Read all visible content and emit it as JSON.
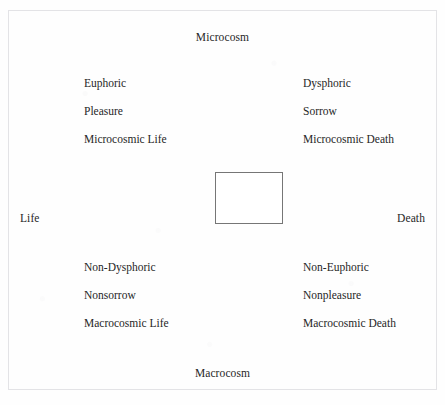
{
  "diagram": {
    "axes": {
      "top_label": "Microcosm",
      "bottom_label": "Macrocosm",
      "left_label": "Life",
      "right_label": "Death"
    },
    "quadrants": {
      "top_left": {
        "terms": [
          "Euphoric",
          "Pleasure",
          "Microcosmic Life"
        ]
      },
      "top_right": {
        "terms": [
          "Dysphoric",
          "Sorrow",
          "Microcosmic Death"
        ]
      },
      "bottom_left": {
        "terms": [
          "Non-Dysphoric",
          "Nonsorrow",
          "Macrocosmic Life"
        ]
      },
      "bottom_right": {
        "terms": [
          "Non-Euphoric",
          "Nonpleasure",
          "Macrocosmic Death"
        ]
      }
    },
    "center_box": {
      "label": ""
    },
    "colors": {
      "page_background": "#fefefe",
      "page_border": "#e3e3e6",
      "text": "#262626",
      "box_border": "#767676"
    }
  }
}
